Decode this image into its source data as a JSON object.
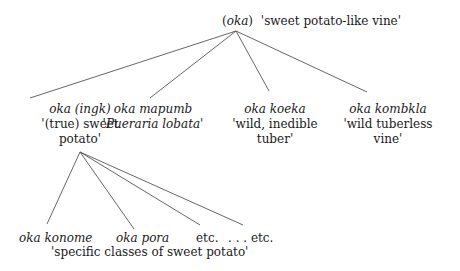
{
  "root": {
    "term_paren_open": "(",
    "term": "oka",
    "term_paren_close": ")",
    "gloss": "'sweet potato-like vine'"
  },
  "level1": [
    {
      "term": "oka",
      "term_extra": "(ingk)",
      "gloss_line1": "'(true) sweet",
      "gloss_line2": "potato'"
    },
    {
      "term": "oka mapumb",
      "gloss_prefix": "'",
      "gloss_italic": "Pueraria lobata",
      "gloss_suffix": "'"
    },
    {
      "term": "oka koeka",
      "gloss_line1": "'wild, inedible",
      "gloss_line2": "tuber'"
    },
    {
      "term": "oka kombkla",
      "gloss_line1": "'wild tuberless",
      "gloss_line2": "vine'"
    }
  ],
  "level2": {
    "items": [
      "oka konome",
      "oka pora",
      "etc.",
      ". . . etc."
    ],
    "gloss": "'specific classes of sweet potato'"
  },
  "colors": {
    "line": "#555555",
    "text": "#1a1a1a",
    "background": "#ffffff"
  }
}
